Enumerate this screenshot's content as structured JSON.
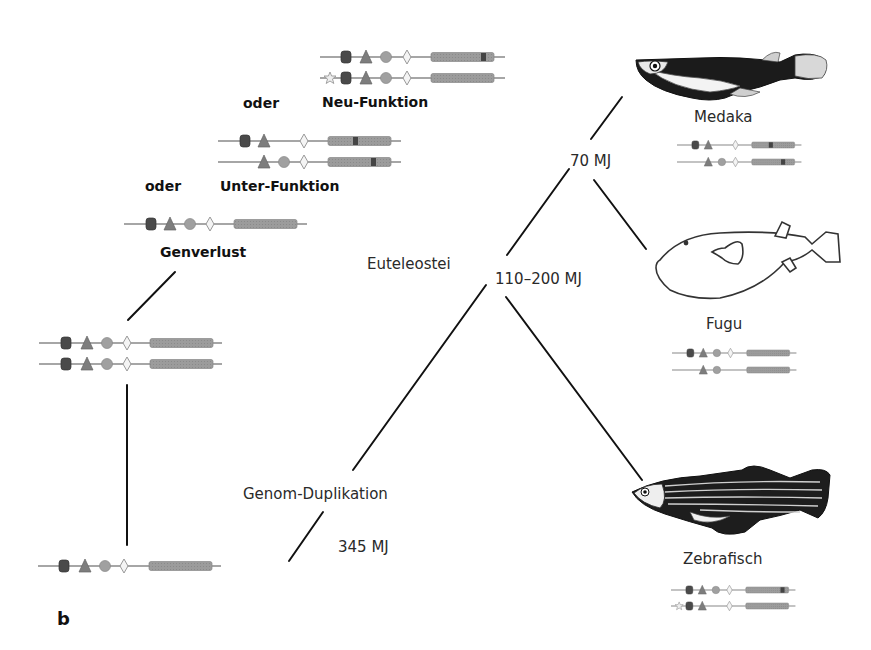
{
  "panel_letter": "b",
  "scenarios": {
    "new_function": {
      "label": "Neu-Funktion",
      "connector": "oder"
    },
    "sub_function": {
      "label": "Unter-Funktion",
      "connector": "oder"
    },
    "gene_loss": {
      "label": "Genverlust"
    }
  },
  "tree": {
    "clade_label": "Euteleostei",
    "node_times": {
      "duplication": "345 MJ",
      "euteleostei": "110–200 MJ",
      "medaka_fugu": "70 MJ"
    },
    "event_label": "Genom-Duplikation"
  },
  "species": [
    {
      "name": "Medaka",
      "icon": "medaka-fish-icon"
    },
    {
      "name": "Fugu",
      "icon": "pufferfish-icon"
    },
    {
      "name": "Zebrafisch",
      "icon": "zebrafish-icon"
    }
  ],
  "gene_elements": {
    "legend": [
      "star-element",
      "square-element",
      "triangle-element",
      "circle-element",
      "diamond-element",
      "coding-region"
    ],
    "colors": {
      "square": "#4a4a4a",
      "triangle": "#7a7a7a",
      "circle": "#9a9a9a",
      "diamond": "#f2f2f2",
      "coding": "#9c9c9c",
      "line": "#8a8a8a",
      "mutation": "#444444"
    }
  }
}
